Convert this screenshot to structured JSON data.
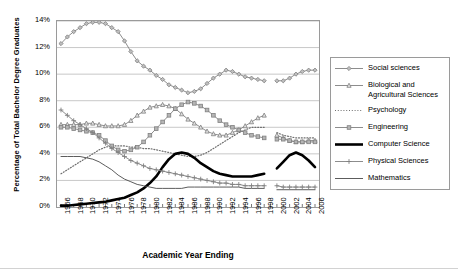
{
  "chart_data": {
    "type": "line",
    "title": "",
    "xlabel": "Academic Year Ending",
    "ylabel": "Percentage of Total Bachelor Degree Graduates",
    "grid": true,
    "legend_position": "right",
    "xlim": [
      1966,
      2006
    ],
    "ylim": [
      0,
      14
    ],
    "ytick_labels": [
      "14%",
      "12%",
      "10%",
      "8%",
      "6%",
      "4%",
      "2%",
      "0%"
    ],
    "ytick_values": [
      14,
      12,
      10,
      8,
      6,
      4,
      2,
      0
    ],
    "xtick_labels": [
      "1966",
      "1968",
      "1970",
      "1972",
      "1974",
      "1976",
      "1978",
      "1980",
      "1982",
      "1984",
      "1986",
      "1988",
      "1990",
      "1992",
      "1994",
      "1996",
      "1998",
      "2000",
      "2002",
      "2004",
      "2006"
    ],
    "x": [
      1966,
      1967,
      1968,
      1969,
      1970,
      1971,
      1972,
      1973,
      1974,
      1975,
      1976,
      1977,
      1978,
      1979,
      1980,
      1981,
      1982,
      1983,
      1984,
      1985,
      1986,
      1987,
      1988,
      1989,
      1990,
      1991,
      1992,
      1993,
      1994,
      1995,
      1996,
      1997,
      1998,
      1999,
      2000,
      2001,
      2002,
      2003,
      2004,
      2005,
      2006
    ],
    "note": "Series break between 1998 and 2000; 1999 value missing for all series.",
    "series": [
      {
        "name": "Social sciences",
        "marker": "diamond",
        "style": "solid-thin",
        "values": [
          12.3,
          12.8,
          13.2,
          13.5,
          13.8,
          13.9,
          13.9,
          13.8,
          13.5,
          13.2,
          12.5,
          11.7,
          11.0,
          10.6,
          10.3,
          9.9,
          9.6,
          9.2,
          9.0,
          8.8,
          8.6,
          8.7,
          8.9,
          9.3,
          9.7,
          10.0,
          10.3,
          10.2,
          10.0,
          9.8,
          9.7,
          9.6,
          9.5,
          null,
          9.5,
          9.5,
          9.7,
          10.0,
          10.2,
          10.3,
          10.3
        ]
      },
      {
        "name": "Biological and Agricultural Sciences",
        "marker": "triangle",
        "style": "solid-thin",
        "values": [
          6.2,
          6.2,
          6.2,
          6.2,
          6.3,
          6.3,
          6.2,
          6.1,
          6.1,
          6.1,
          6.2,
          6.5,
          6.9,
          7.2,
          7.5,
          7.6,
          7.7,
          7.6,
          7.4,
          7.0,
          6.6,
          6.3,
          6.0,
          5.7,
          5.5,
          5.4,
          5.4,
          5.6,
          5.8,
          6.1,
          6.4,
          6.7,
          6.9,
          null,
          5.4,
          5.2,
          5.0,
          4.9,
          4.9,
          5.0,
          5.0
        ]
      },
      {
        "name": "Psychology",
        "marker": "none",
        "style": "dotted",
        "values": [
          2.5,
          2.8,
          3.1,
          3.4,
          3.7,
          4.0,
          4.3,
          4.5,
          4.6,
          4.6,
          4.6,
          4.5,
          4.5,
          4.4,
          4.4,
          4.3,
          4.2,
          4.1,
          4.0,
          3.9,
          3.8,
          3.8,
          3.9,
          4.1,
          4.4,
          4.7,
          5.0,
          5.3,
          5.6,
          5.8,
          6.0,
          6.0,
          6.0,
          null,
          5.6,
          5.4,
          5.3,
          5.2,
          5.2,
          5.2,
          5.2
        ]
      },
      {
        "name": "Engineering",
        "marker": "square",
        "style": "solid-thin",
        "values": [
          6.0,
          6.0,
          5.9,
          5.8,
          5.7,
          5.6,
          5.4,
          5.0,
          4.6,
          4.3,
          4.2,
          4.3,
          4.5,
          4.9,
          5.4,
          5.9,
          6.4,
          6.9,
          7.4,
          7.7,
          7.9,
          7.8,
          7.6,
          7.3,
          6.9,
          6.5,
          6.2,
          6.0,
          5.8,
          5.6,
          5.4,
          5.3,
          5.2,
          null,
          5.1,
          5.1,
          5.0,
          4.9,
          4.9,
          4.9,
          4.9
        ]
      },
      {
        "name": "Computer Science",
        "marker": "none",
        "style": "solid-thick",
        "values": [
          0.1,
          0.1,
          0.15,
          0.2,
          0.25,
          0.3,
          0.35,
          0.4,
          0.5,
          0.6,
          0.7,
          0.9,
          1.1,
          1.4,
          1.8,
          2.3,
          3.0,
          3.6,
          4.0,
          4.1,
          4.0,
          3.7,
          3.3,
          3.0,
          2.7,
          2.5,
          2.4,
          2.3,
          2.3,
          2.3,
          2.3,
          2.4,
          2.5,
          null,
          2.9,
          3.4,
          3.9,
          4.1,
          3.9,
          3.5,
          3.0
        ]
      },
      {
        "name": "Physical Sciences",
        "marker": "plus",
        "style": "solid-thin",
        "values": [
          7.3,
          6.9,
          6.5,
          6.2,
          5.9,
          5.6,
          5.2,
          4.8,
          4.4,
          4.1,
          3.8,
          3.5,
          3.3,
          3.1,
          2.9,
          2.8,
          2.7,
          2.6,
          2.5,
          2.4,
          2.3,
          2.2,
          2.1,
          2.0,
          1.9,
          1.8,
          1.8,
          1.7,
          1.7,
          1.6,
          1.6,
          1.6,
          1.6,
          null,
          1.6,
          1.5,
          1.5,
          1.5,
          1.5,
          1.5,
          1.5
        ]
      },
      {
        "name": "Mathematics",
        "marker": "none",
        "style": "solid-thin2",
        "values": [
          3.8,
          3.8,
          3.8,
          3.8,
          3.7,
          3.6,
          3.4,
          3.1,
          2.8,
          2.4,
          2.1,
          1.9,
          1.7,
          1.6,
          1.5,
          1.4,
          1.4,
          1.4,
          1.4,
          1.4,
          1.5,
          1.5,
          1.5,
          1.5,
          1.5,
          1.5,
          1.5,
          1.5,
          1.5,
          1.4,
          1.4,
          1.4,
          1.4,
          null,
          1.3,
          1.3,
          1.3,
          1.3,
          1.3,
          1.3,
          1.3
        ]
      }
    ]
  },
  "legend": {
    "items": [
      {
        "label": "Social sciences"
      },
      {
        "label": "Biological and Agricultural Sciences"
      },
      {
        "label": "Psychology"
      },
      {
        "label": "Engineering"
      },
      {
        "label": "Computer Science"
      },
      {
        "label": "Physical Sciences"
      },
      {
        "label": "Mathematics"
      }
    ]
  },
  "colors": {
    "series_line": "#808080",
    "emphasis_line": "#000000",
    "grid": "#c8c8c8",
    "frame": "#9a9a9a",
    "text": "#000000",
    "background": "#ffffff"
  }
}
